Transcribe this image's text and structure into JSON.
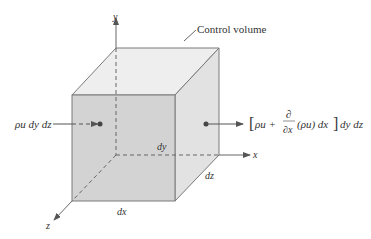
{
  "diagram": {
    "title_label": "Control volume",
    "axes": {
      "x": "x",
      "y": "y",
      "z": "z"
    },
    "dimensions": {
      "dx": "dx",
      "dy": "dy",
      "dz": "dz"
    },
    "inflow": {
      "label": "ρu dy dz"
    },
    "outflow": {
      "bracket_open": "[",
      "rho_u": "ρu +",
      "partial_num": "∂",
      "partial_den": "∂x",
      "term": "(ρu) dx",
      "bracket_close": "]",
      "tail": "dy dz"
    },
    "colors": {
      "front_face": "#d3d3d3",
      "top_face": "#eeeeee",
      "side_face": "#e2e2e2",
      "edges": "#7a7a7a",
      "axes": "#555555",
      "text": "#333333"
    }
  }
}
